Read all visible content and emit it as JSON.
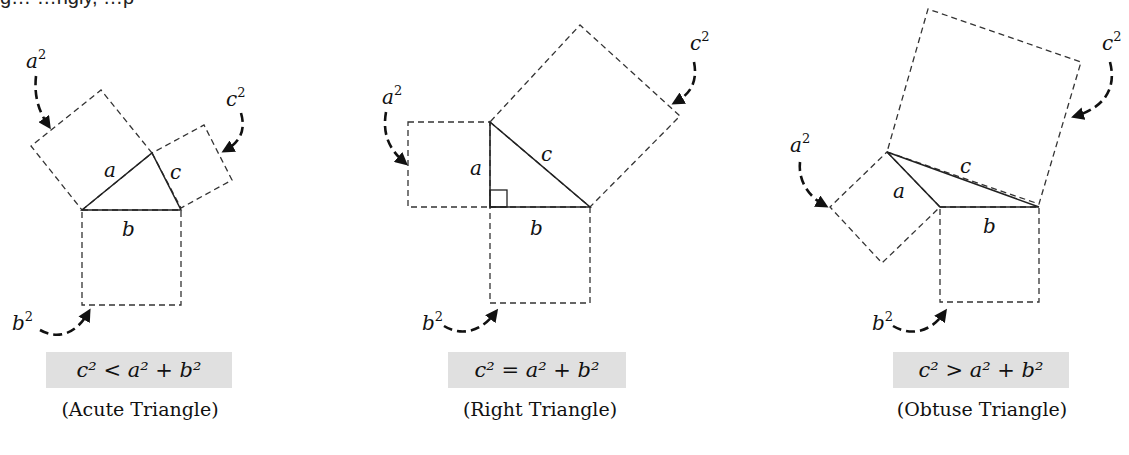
{
  "header_fragment": "g…      …ngly,                    …p",
  "figures": [
    {
      "id": "acute",
      "side_labels": {
        "a": "a",
        "b": "b",
        "c": "c"
      },
      "square_labels": {
        "a2": "a",
        "b2": "b",
        "c2": "c",
        "exp": "2"
      },
      "equation": "c² < a² + b²",
      "caption": "(Acute Triangle)"
    },
    {
      "id": "right",
      "side_labels": {
        "a": "a",
        "b": "b",
        "c": "c"
      },
      "square_labels": {
        "a2": "a",
        "b2": "b",
        "c2": "c",
        "exp": "2"
      },
      "equation": "c² = a² + b²",
      "caption": "(Right Triangle)"
    },
    {
      "id": "obtuse",
      "side_labels": {
        "a": "a",
        "b": "b",
        "c": "c"
      },
      "square_labels": {
        "a2": "a",
        "b2": "b",
        "c2": "c",
        "exp": "2"
      },
      "equation": "c² > a² + b²",
      "caption": "(Obtuse Triangle)"
    }
  ],
  "colors": {
    "stroke": "#222222",
    "equation_bg": "#e0e0e0"
  }
}
